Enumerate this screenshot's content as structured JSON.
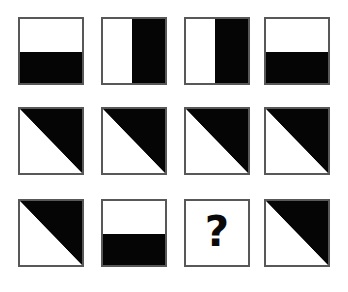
{
  "puzzle": {
    "type": "visual-pattern-matrix",
    "rows": 3,
    "columns": 4,
    "unknown_marker": "?",
    "colors": {
      "fill_black": "#050505",
      "fill_white": "#ffffff",
      "border": "#585858",
      "background": "#ffffff",
      "marker": "#0a0a0a"
    },
    "pattern_names": {
      "horizontal_split": "horizontal-split-white-top-black-bottom",
      "vertical_split": "vertical-split-white-left-black-right",
      "diagonal": "diagonal-black-upper-right",
      "unknown": "unknown-question-mark"
    },
    "cells": [
      [
        {
          "pattern": "horizontal-split",
          "label": "white top half, black bottom half"
        },
        {
          "pattern": "vertical-split",
          "label": "white left half, black right half"
        },
        {
          "pattern": "vertical-split",
          "label": "white left half, black right half"
        },
        {
          "pattern": "horizontal-split",
          "label": "white top half, black bottom half"
        }
      ],
      [
        {
          "pattern": "diagonal",
          "label": "black upper-right triangle"
        },
        {
          "pattern": "diagonal",
          "label": "black upper-right triangle"
        },
        {
          "pattern": "diagonal",
          "label": "black upper-right triangle"
        },
        {
          "pattern": "diagonal",
          "label": "black upper-right triangle"
        }
      ],
      [
        {
          "pattern": "diagonal",
          "label": "black upper-right triangle"
        },
        {
          "pattern": "horizontal-split",
          "label": "white top half, black bottom half"
        },
        {
          "pattern": "unknown",
          "label": "?"
        },
        {
          "pattern": "diagonal",
          "label": "black upper-right triangle"
        }
      ]
    ]
  }
}
